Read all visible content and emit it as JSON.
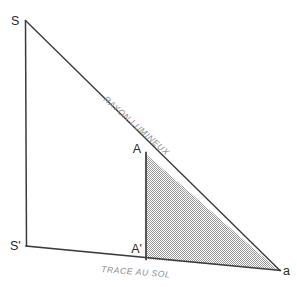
{
  "figure": {
    "background_color": "#ffffff",
    "line_color": "#333333",
    "annotation_color": "#8d8d8d",
    "shade_color": "#b4b4b4",
    "vertices": [
      {
        "id": "S",
        "label": "S",
        "x": 25,
        "y": 20,
        "label_x": 11,
        "label_y": 16
      },
      {
        "id": "Sp",
        "label": "S'",
        "x": 26,
        "y": 246,
        "label_x": 11,
        "label_y": 250
      },
      {
        "id": "A",
        "label": "A",
        "x": 146,
        "y": 152,
        "label_x": 132,
        "label_y": 152
      },
      {
        "id": "Ap",
        "label": "A'",
        "x": 146,
        "y": 259,
        "label_x": 132,
        "label_y": 253
      },
      {
        "id": "a",
        "label": "a",
        "x": 280,
        "y": 271,
        "label_x": 284,
        "label_y": 274
      }
    ],
    "annotations": [
      {
        "id": "ray-label",
        "text": "RAYON LUMINEUX",
        "x": 103,
        "y": 100,
        "rotation": 41.5
      },
      {
        "id": "ground-label",
        "text": "TRACE AU SOL",
        "x": 101,
        "y": 272,
        "rotation": 4.6
      }
    ],
    "shaded_region": {
      "id": "shadow-triangle",
      "points": "146,154 146,259 278,270",
      "fill_pattern": "checker-stipple"
    }
  }
}
